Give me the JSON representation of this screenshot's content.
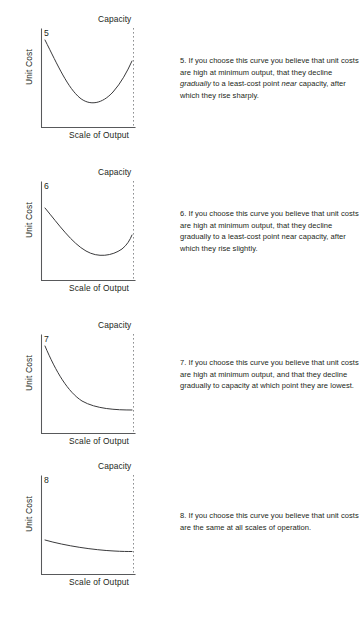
{
  "page": {
    "background_color": "#ffffff",
    "text_color": "#231f20",
    "axis_color": "#58595b",
    "curve_color": "#3a3a3c",
    "capacity_line_color": "#8e9092"
  },
  "blocks": [
    {
      "number": "5",
      "capacity_label": "Capacity",
      "y_axis_label": "Unit Cost",
      "x_axis_label": "Scale of Output",
      "text_plain": "5. If you choose this curve you believe that unit costs are high at minimum output, that they decline gradually to a least-cost point near capacity, after which they rise sharply.",
      "text_html": "5. If you choose this curve you believe that unit costs are high at minimum output, that they decline <em>gradually</em> to a least-cost point <em>near</em> capacity, after which they rise sharply."
    },
    {
      "number": "6",
      "capacity_label": "Capacity",
      "y_axis_label": "Unit Cost",
      "x_axis_label": "Scale of Output",
      "text_plain": "6. If you choose this curve you believe that unit costs are high at minimum output, that they decline gradually to a least-cost point near capacity, after which they rise slightly.",
      "text_html": "6. If you choose this curve you believe that unit costs are high at minimum output, that they decline gradually to a least-cost point near capacity, after which they rise slightly."
    },
    {
      "number": "7",
      "capacity_label": "Capacity",
      "y_axis_label": "Unit Cost",
      "x_axis_label": "Scale of Output",
      "text_plain": "7. If you choose this curve you believe that unit costs are high at minimum output, and that they decline gradually to capacity at which point they are lowest.",
      "text_html": "7. If you choose this curve you believe that unit costs are high at minimum output, and that they decline gradually to capacity at which point they are lowest."
    },
    {
      "number": "8",
      "capacity_label": "Capacity",
      "y_axis_label": "Unit Cost",
      "x_axis_label": "Scale of Output",
      "text_plain": "8. If you choose this curve you believe that unit costs are the same at all scales of operation.",
      "text_html": "8. If you choose this curve you believe that unit costs are the same at all scales of operation."
    }
  ],
  "chart_data": [
    {
      "type": "line",
      "title": "5",
      "xlabel": "Scale of Output",
      "ylabel": "Unit Cost",
      "annotations": [
        "Capacity"
      ],
      "grid": false,
      "legend": "none",
      "xlim": [
        0,
        100
      ],
      "ylim": [
        0,
        100
      ],
      "capacity_x": 95,
      "description": "U-shaped cost curve: high at minimum output, declines gradually to a least-cost point near capacity, then rises sharply.",
      "x": [
        8,
        20,
        32,
        44,
        56,
        68,
        78,
        86,
        92,
        95
      ],
      "y": [
        82,
        66,
        52,
        40,
        30,
        24,
        24,
        30,
        42,
        52
      ]
    },
    {
      "type": "line",
      "title": "6",
      "xlabel": "Scale of Output",
      "ylabel": "Unit Cost",
      "annotations": [
        "Capacity"
      ],
      "grid": false,
      "legend": "none",
      "xlim": [
        0,
        100
      ],
      "ylim": [
        0,
        100
      ],
      "capacity_x": 95,
      "description": "Shallow U-shaped cost curve: declines gradually to a least-cost point near capacity, then rises slightly.",
      "x": [
        8,
        20,
        32,
        44,
        56,
        68,
        78,
        86,
        92,
        95
      ],
      "y": [
        70,
        59,
        49,
        40,
        32,
        26,
        23,
        23,
        26,
        30
      ]
    },
    {
      "type": "line",
      "title": "7",
      "xlabel": "Scale of Output",
      "ylabel": "Unit Cost",
      "annotations": [
        "Capacity"
      ],
      "grid": false,
      "legend": "none",
      "xlim": [
        0,
        100
      ],
      "ylim": [
        0,
        100
      ],
      "capacity_x": 95,
      "description": "Decreasing cost curve asymptotic to a floor: high at minimum output, declines gradually to capacity where costs are lowest.",
      "x": [
        8,
        18,
        28,
        38,
        48,
        58,
        68,
        78,
        88,
        95
      ],
      "y": [
        82,
        68,
        55,
        44,
        36,
        31,
        28,
        26,
        25,
        25
      ]
    },
    {
      "type": "line",
      "title": "8",
      "xlabel": "Scale of Output",
      "ylabel": "Unit Cost",
      "annotations": [
        "Capacity"
      ],
      "grid": false,
      "legend": "none",
      "xlim": [
        0,
        100
      ],
      "ylim": [
        0,
        100
      ],
      "capacity_x": 95,
      "description": "Essentially flat cost curve: unit costs are the same at all scales of operation.",
      "x": [
        8,
        20,
        32,
        44,
        56,
        68,
        80,
        88,
        95
      ],
      "y": [
        33,
        30,
        28,
        26,
        25,
        24,
        24,
        24,
        24
      ]
    }
  ]
}
